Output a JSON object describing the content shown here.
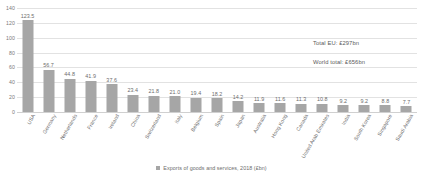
{
  "chart_data": {
    "type": "bar",
    "title": "",
    "subtitle": "",
    "xlabel": "",
    "ylabel": "",
    "ylim": [
      0,
      140
    ],
    "ytick_step": 20,
    "yticks": [
      "0",
      "20",
      "40",
      "60",
      "80",
      "100",
      "120",
      "140"
    ],
    "grid": true,
    "legend_position": "bottom-center",
    "legend": [
      "Exports of goods and services, 2018 (£bn)"
    ],
    "series_color": "#a6a6a6",
    "categories": [
      "USA",
      "Germany",
      "Netherlands",
      "France",
      "Ireland",
      "China",
      "Switzerland",
      "Italy",
      "Belgium",
      "Spain",
      "Japan",
      "Australia",
      "Hong Kong",
      "Canada",
      "United Arab Emirates",
      "India",
      "South Korea",
      "Singapore",
      "Saudi Arabia"
    ],
    "values": [
      123.5,
      56.7,
      44.8,
      41.9,
      37.6,
      23.4,
      21.8,
      21.0,
      19.4,
      18.2,
      14.2,
      11.9,
      11.6,
      11.3,
      10.8,
      9.2,
      9.2,
      8.8,
      7.7
    ],
    "value_labels": [
      "123.5",
      "56.7",
      "44.8",
      "41.9",
      "37.6",
      "23.4",
      "21.8",
      "21.0",
      "19.4",
      "18.2",
      "14.2",
      "11.9",
      "11.6",
      "11.3",
      "10.8",
      "9.2",
      "9.2",
      "8.8",
      "7.7"
    ],
    "annotations": [
      "Total EU: £297bn",
      "World total: £656bn"
    ]
  },
  "legend": {
    "swatch_icon": "legend-square-icon",
    "label": "Exports of goods and services, 2018 (£bn)"
  },
  "annotations": {
    "total_eu": "Total EU: £297bn",
    "world_total": "World total: £656bn"
  }
}
